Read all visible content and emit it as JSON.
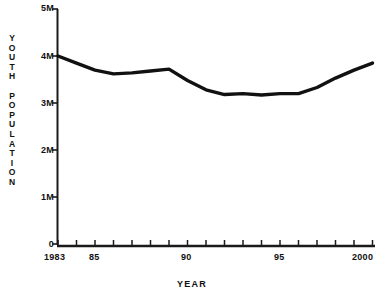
{
  "chart_data": {
    "type": "line",
    "title": "",
    "xlabel": "YEAR",
    "ylabel": "YOUTH POPULATION",
    "ylabel_chars": [
      "Y",
      "O",
      "U",
      "T",
      "H",
      "",
      "P",
      "O",
      "P",
      "U",
      "L",
      "A",
      "T",
      "I",
      "O",
      "N"
    ],
    "xlim": [
      1983,
      2000
    ],
    "ylim": [
      0,
      5000000
    ],
    "grid": false,
    "legend": null,
    "y_ticks": [
      0,
      1000000,
      2000000,
      3000000,
      4000000,
      5000000
    ],
    "y_tick_labels": [
      "0",
      "1M",
      "2M",
      "3M",
      "4M",
      "5M"
    ],
    "x_ticks": [
      1983,
      1984,
      1985,
      1986,
      1987,
      1988,
      1989,
      1990,
      1991,
      1992,
      1993,
      1994,
      1995,
      1996,
      1997,
      1998,
      1999,
      2000
    ],
    "x_tick_labels": [
      "1983",
      "",
      "85",
      "",
      "",
      "",
      "",
      "90",
      "",
      "",
      "",
      "",
      "95",
      "",
      "",
      "",
      "",
      "2000"
    ],
    "x": [
      1983,
      1984,
      1985,
      1986,
      1987,
      1988,
      1989,
      1990,
      1991,
      1992,
      1993,
      1994,
      1995,
      1996,
      1997,
      1998,
      1999,
      2000
    ],
    "values": [
      4000000,
      3850000,
      3700000,
      3620000,
      3640000,
      3680000,
      3720000,
      3480000,
      3280000,
      3180000,
      3200000,
      3170000,
      3200000,
      3200000,
      3330000,
      3530000,
      3700000,
      3850000
    ],
    "series": [
      {
        "name": "Youth Population",
        "color": "#111111",
        "values": [
          4000000,
          3850000,
          3700000,
          3620000,
          3640000,
          3680000,
          3720000,
          3480000,
          3280000,
          3180000,
          3200000,
          3170000,
          3200000,
          3200000,
          3330000,
          3530000,
          3700000,
          3850000
        ]
      }
    ],
    "line_color": "#111111",
    "axis_color": "#1a1a1a",
    "background": "#ffffff"
  }
}
